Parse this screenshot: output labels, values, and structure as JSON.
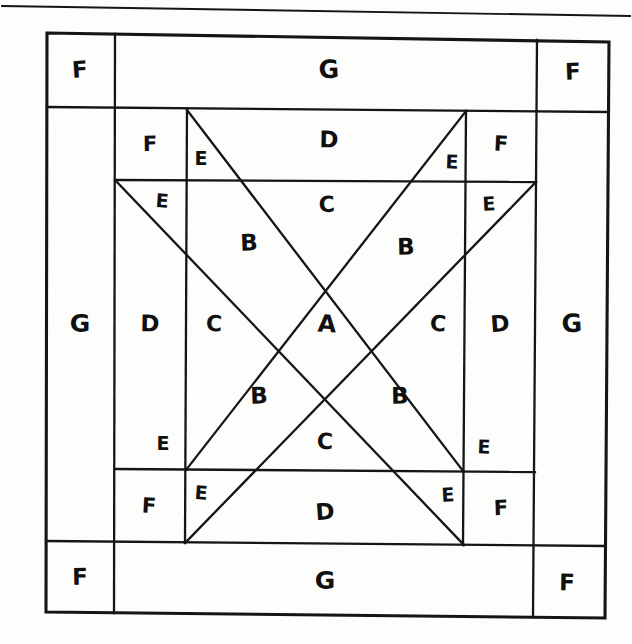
{
  "figure": {
    "kind": "quilt-block-piecing-diagram",
    "style": "hand-drawn-pencil-on-paper",
    "ink_color": "#151515",
    "paper_color": "#fdfdfb",
    "top_rule": true
  },
  "patch_letters": [
    "A",
    "B",
    "C",
    "D",
    "E",
    "F",
    "G"
  ],
  "labels": [
    {
      "id": "f-outer-tl",
      "text": "F",
      "x": 80,
      "y": 71,
      "size": 23
    },
    {
      "id": "g-outer-top",
      "text": "G",
      "x": 329,
      "y": 71,
      "size": 25
    },
    {
      "id": "f-outer-tr",
      "text": "F",
      "x": 573,
      "y": 73,
      "size": 23
    },
    {
      "id": "f-inner-tl",
      "text": "F",
      "x": 150,
      "y": 145,
      "size": 21
    },
    {
      "id": "e-top-left",
      "text": "E",
      "x": 201,
      "y": 159,
      "size": 19
    },
    {
      "id": "d-top",
      "text": "D",
      "x": 329,
      "y": 141,
      "size": 23
    },
    {
      "id": "e-top-right",
      "text": "E",
      "x": 452,
      "y": 163,
      "size": 19
    },
    {
      "id": "f-inner-tr",
      "text": "F",
      "x": 501,
      "y": 145,
      "size": 21
    },
    {
      "id": "e-upper-left",
      "text": "E",
      "x": 162,
      "y": 202,
      "size": 19
    },
    {
      "id": "c-top",
      "text": "C",
      "x": 327,
      "y": 206,
      "size": 22
    },
    {
      "id": "e-upper-right",
      "text": "E",
      "x": 489,
      "y": 205,
      "size": 19
    },
    {
      "id": "b-upper-left",
      "text": "B",
      "x": 249,
      "y": 244,
      "size": 23
    },
    {
      "id": "b-upper-right",
      "text": "B",
      "x": 406,
      "y": 248,
      "size": 23
    },
    {
      "id": "g-left",
      "text": "G",
      "x": 80,
      "y": 325,
      "size": 25
    },
    {
      "id": "d-left",
      "text": "D",
      "x": 150,
      "y": 325,
      "size": 23
    },
    {
      "id": "c-left",
      "text": "C",
      "x": 214,
      "y": 325,
      "size": 22
    },
    {
      "id": "a-center",
      "text": "A",
      "x": 327,
      "y": 325,
      "size": 24
    },
    {
      "id": "c-right",
      "text": "C",
      "x": 438,
      "y": 325,
      "size": 22
    },
    {
      "id": "d-right",
      "text": "D",
      "x": 500,
      "y": 325,
      "size": 23
    },
    {
      "id": "g-right",
      "text": "G",
      "x": 572,
      "y": 325,
      "size": 25
    },
    {
      "id": "b-lower-left",
      "text": "B",
      "x": 259,
      "y": 397,
      "size": 23
    },
    {
      "id": "b-lower-right",
      "text": "B",
      "x": 400,
      "y": 397,
      "size": 23
    },
    {
      "id": "e-lower-left",
      "text": "E",
      "x": 163,
      "y": 444,
      "size": 19
    },
    {
      "id": "c-bottom",
      "text": "C",
      "x": 325,
      "y": 443,
      "size": 22
    },
    {
      "id": "e-lower-right",
      "text": "E",
      "x": 484,
      "y": 448,
      "size": 19
    },
    {
      "id": "f-inner-bl",
      "text": "F",
      "x": 149,
      "y": 507,
      "size": 21
    },
    {
      "id": "e-bot-left",
      "text": "E",
      "x": 201,
      "y": 494,
      "size": 19
    },
    {
      "id": "d-bottom",
      "text": "D",
      "x": 325,
      "y": 513,
      "size": 23
    },
    {
      "id": "e-bot-right",
      "text": "E",
      "x": 448,
      "y": 496,
      "size": 19
    },
    {
      "id": "f-inner-br",
      "text": "F",
      "x": 501,
      "y": 509,
      "size": 21
    },
    {
      "id": "f-outer-bl",
      "text": "F",
      "x": 80,
      "y": 578,
      "size": 23
    },
    {
      "id": "g-outer-bot",
      "text": "G",
      "x": 325,
      "y": 582,
      "size": 25
    },
    {
      "id": "f-outer-br",
      "text": "F",
      "x": 567,
      "y": 584,
      "size": 23
    }
  ],
  "geometry": {
    "top_rule": {
      "x1": 2,
      "y1": 6,
      "x2": 630,
      "y2": 16
    },
    "outer_frame": {
      "tl": [
        47,
        33
      ],
      "tr": [
        609,
        42
      ],
      "br": [
        605,
        618
      ],
      "bl": [
        46,
        612
      ]
    },
    "border_offsets": {
      "left": 114,
      "right": 535,
      "top": 110,
      "bottom": 540
    },
    "inner_square": {
      "left": 115,
      "top": 110,
      "right": 536,
      "bottom": 539
    },
    "corner_square": {
      "left": 186,
      "top": 181,
      "right": 466,
      "bottom": 469
    },
    "center": [
      325,
      325
    ]
  }
}
